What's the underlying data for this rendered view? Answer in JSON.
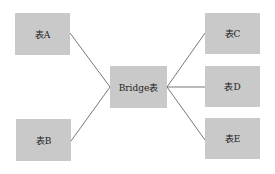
{
  "diagram": {
    "nodes": [
      {
        "id": "A",
        "label": "表A"
      },
      {
        "id": "B",
        "label": "表B"
      },
      {
        "id": "bridge",
        "label": "Bridge表"
      },
      {
        "id": "C",
        "label": "表C"
      },
      {
        "id": "D",
        "label": "表D"
      },
      {
        "id": "E",
        "label": "表E"
      }
    ],
    "edges": [
      {
        "from": "bridge",
        "to": "A"
      },
      {
        "from": "bridge",
        "to": "B"
      },
      {
        "from": "bridge",
        "to": "C"
      },
      {
        "from": "bridge",
        "to": "D"
      },
      {
        "from": "bridge",
        "to": "E"
      }
    ],
    "colors": {
      "box": "#c9c9c9",
      "line": "#555555"
    }
  }
}
